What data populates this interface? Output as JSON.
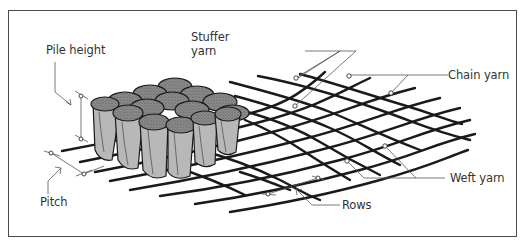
{
  "figure": {
    "labels": {
      "pile_height": "Pile height",
      "stuffer_yarn_line1": "Stuffer",
      "stuffer_yarn_line2": "yarn",
      "chain_yarn": "Chain yarn",
      "pitch": "Pitch",
      "weft_yarn": "Weft yarn",
      "rows": "Rows"
    },
    "colors": {
      "border": "#4a4a4a",
      "yarn": "#1a1a1a",
      "tuft_side": "#b8b8b8",
      "tuft_top": "#8a8a8a",
      "leader": "#555555",
      "text": "#333333"
    }
  }
}
